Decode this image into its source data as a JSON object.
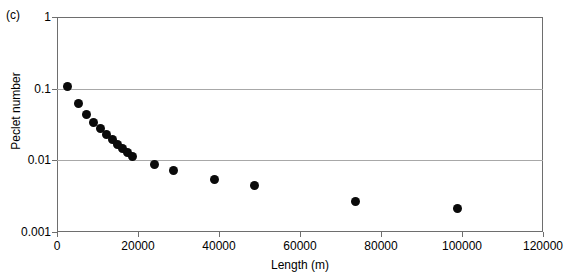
{
  "panel": {
    "label": "(c)"
  },
  "chart_data": {
    "type": "scatter",
    "title": "",
    "panel_label": "(c)",
    "xlabel": "Length (m)",
    "ylabel": "Peclet number",
    "xlim": [
      0,
      120000
    ],
    "ylim": [
      0.001,
      1
    ],
    "yscale": "log",
    "xscale": "linear",
    "grid": true,
    "gridlines_y": [
      1,
      0.1,
      0.01,
      0.001
    ],
    "legend": "none",
    "xticks": [
      0,
      20000,
      40000,
      60000,
      80000,
      100000,
      120000
    ],
    "xticklabels": [
      "0",
      "20000",
      "40000",
      "60000",
      "80000",
      "100000",
      "120000"
    ],
    "yticks": [
      1,
      0.1,
      0.01,
      0.001
    ],
    "yticklabels": [
      "1",
      "0.1",
      "0.01",
      "0.001"
    ],
    "marker": "filled-circle",
    "marker_color": "#0a0a0a",
    "marker_size": 9,
    "points": [
      {
        "x": 2600,
        "y": 0.107
      },
      {
        "x": 5300,
        "y": 0.062
      },
      {
        "x": 7200,
        "y": 0.044
      },
      {
        "x": 9100,
        "y": 0.034
      },
      {
        "x": 10800,
        "y": 0.028
      },
      {
        "x": 12300,
        "y": 0.023
      },
      {
        "x": 13700,
        "y": 0.0195
      },
      {
        "x": 15000,
        "y": 0.0168
      },
      {
        "x": 16200,
        "y": 0.0148
      },
      {
        "x": 17400,
        "y": 0.013
      },
      {
        "x": 18700,
        "y": 0.0113
      },
      {
        "x": 24000,
        "y": 0.0088
      },
      {
        "x": 28800,
        "y": 0.0073
      },
      {
        "x": 39000,
        "y": 0.0054
      },
      {
        "x": 48800,
        "y": 0.0044
      },
      {
        "x": 73800,
        "y": 0.0027
      },
      {
        "x": 98800,
        "y": 0.0021
      }
    ],
    "x_values": [
      2600,
      5300,
      7200,
      9100,
      10800,
      12300,
      13700,
      15000,
      16200,
      17400,
      18700,
      24000,
      28800,
      39000,
      48800,
      73800,
      98800
    ],
    "y_values": [
      0.107,
      0.062,
      0.044,
      0.034,
      0.028,
      0.023,
      0.0195,
      0.0168,
      0.0148,
      0.013,
      0.0113,
      0.0088,
      0.0073,
      0.0054,
      0.0044,
      0.0027,
      0.0021
    ]
  },
  "colors": {
    "marker": "#0a0a0a",
    "grid": "#a8a8a8",
    "axis": "#6e6e6e",
    "background": "#ffffff",
    "text": "#000000"
  }
}
